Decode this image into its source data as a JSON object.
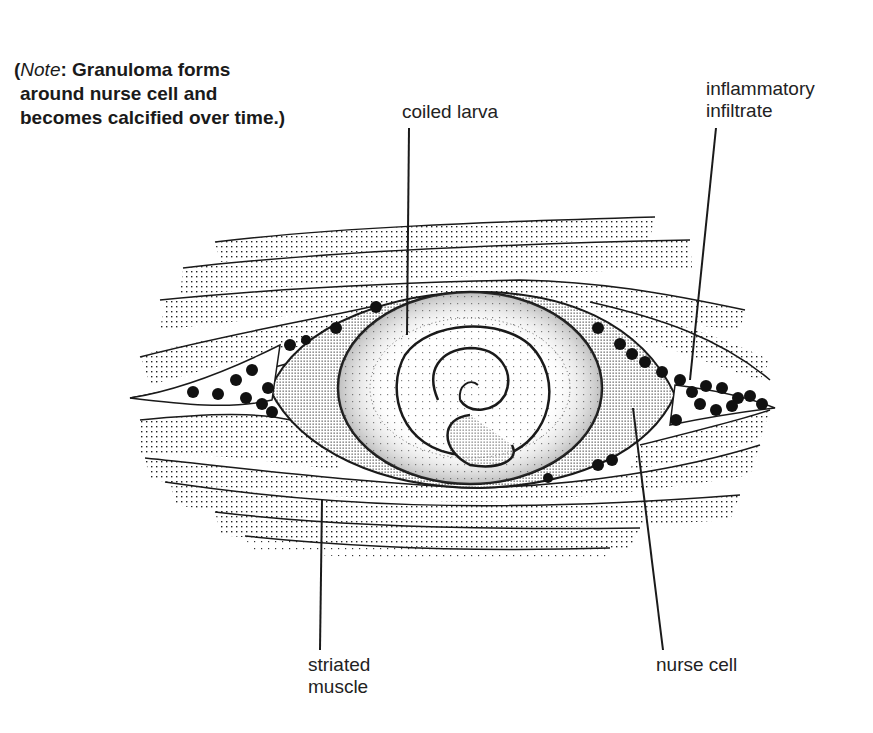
{
  "note": {
    "lead_italic": "Note",
    "lead_punct": ":",
    "line1_rest": " Granuloma forms",
    "line2": "around nurse cell and",
    "line3": "becomes calcified over time.)",
    "open_paren": "("
  },
  "labels": {
    "coiled_larva": "coiled larva",
    "inflammatory_infiltrate_1": "inflammatory",
    "inflammatory_infiltrate_2": "infiltrate",
    "striated_muscle_1": "striated",
    "striated_muscle_2": "muscle",
    "nurse_cell": "nurse cell"
  },
  "colors": {
    "ink": "#1a1a1a",
    "background": "#ffffff"
  }
}
